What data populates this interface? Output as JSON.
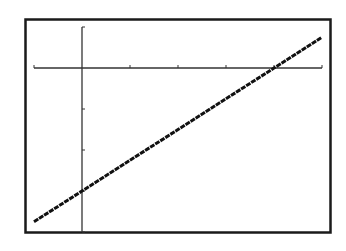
{
  "chart_data": {
    "type": "line",
    "title": "",
    "xlabel": "",
    "ylabel": "",
    "xlim": [
      -1,
      5
    ],
    "ylim": [
      -4,
      1
    ],
    "xscale": 1,
    "yscale": 1,
    "x_ticks": [
      -1,
      0,
      1,
      2,
      3,
      4,
      5
    ],
    "y_ticks": [
      -4,
      -3,
      -2,
      -1,
      0,
      1
    ],
    "grid": false,
    "legend": null,
    "series": [
      {
        "name": "y = 0.75x - 3",
        "equation": "0.75x - 3",
        "x": [
          -1,
          0,
          1,
          2,
          3,
          4,
          5
        ],
        "values": [
          -3.75,
          -3,
          -2.25,
          -1.5,
          -0.75,
          0,
          0.75
        ]
      }
    ],
    "x_intercept": 4,
    "y_intercept": -3
  },
  "colors": {
    "background": "#ffffff",
    "frame": "#1a1a1a",
    "axes": "#333333",
    "plot": "#111111"
  }
}
